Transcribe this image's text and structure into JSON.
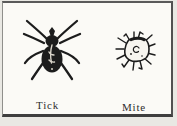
{
  "figure": {
    "items": [
      {
        "label": "Tick"
      },
      {
        "label": "Mite"
      }
    ]
  },
  "colors": {
    "ink": "#1c1c1c",
    "paper": "#fbfaf6",
    "page_background": "#e9e8e3",
    "frame_border_dark": "#3e3e3e",
    "frame_border_light": "#8f8f8b"
  }
}
